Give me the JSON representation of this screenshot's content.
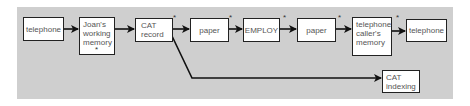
{
  "diagram": {
    "nodes": [
      {
        "id": "n1",
        "label": "telephone"
      },
      {
        "id": "n2",
        "label": "Joan's working memory",
        "lines": [
          "Joan's",
          "working",
          "memory"
        ],
        "starred": true
      },
      {
        "id": "n3",
        "label": "CAT record",
        "lines": [
          "CAT",
          "record"
        ],
        "starred": true
      },
      {
        "id": "n4",
        "label": "paper",
        "starred": true
      },
      {
        "id": "n5",
        "label": "EMPLOY",
        "starred": true
      },
      {
        "id": "n6",
        "label": "paper",
        "starred": true
      },
      {
        "id": "n7",
        "label": "telephone caller's memory",
        "lines": [
          "telephone",
          "caller's",
          "memory"
        ],
        "starred": true
      },
      {
        "id": "n8",
        "label": "telephone"
      },
      {
        "id": "n9",
        "label": "CAT indexing",
        "lines": [
          "CAT",
          "indexing"
        ]
      }
    ],
    "edges": [
      [
        "n1",
        "n2"
      ],
      [
        "n2",
        "n3"
      ],
      [
        "n3",
        "n4"
      ],
      [
        "n4",
        "n5"
      ],
      [
        "n5",
        "n6"
      ],
      [
        "n6",
        "n7"
      ],
      [
        "n7",
        "n8"
      ],
      [
        "n3",
        "n9"
      ]
    ],
    "star_symbol": "*",
    "colors": {
      "background": "#cfcfcf",
      "box": "#ffffff",
      "border": "#222222"
    }
  }
}
